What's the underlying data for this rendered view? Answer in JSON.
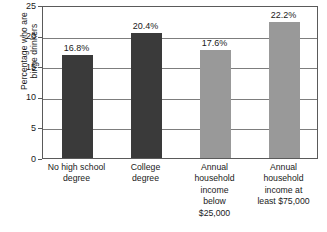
{
  "chart_data": {
    "type": "bar",
    "title": "",
    "xlabel": "",
    "ylabel": "Percentage who are binge drinkers",
    "ylabel_lines": [
      "Percentage who are",
      "binge drinkers"
    ],
    "ylim": [
      0,
      25
    ],
    "yticks": [
      0,
      5,
      10,
      15,
      20,
      25
    ],
    "ytick_labels": [
      "0",
      "5",
      "10",
      "15",
      "20",
      "25"
    ],
    "grid": true,
    "legend": "none",
    "categories": [
      "No high school degree",
      "College degree",
      "Annual household income below $25,000",
      "Annual household income at least $75,000"
    ],
    "category_lines": [
      [
        "No high school",
        "degree"
      ],
      [
        "College",
        "degree"
      ],
      [
        "Annual",
        "household",
        "income",
        "below",
        "$25,000"
      ],
      [
        "Annual",
        "household",
        "income at",
        "least $75,000"
      ]
    ],
    "values": [
      16.8,
      20.4,
      17.6,
      22.2
    ],
    "data_labels": [
      "16.8%",
      "20.4%",
      "17.6%",
      "22.2%"
    ],
    "bar_colors": [
      "#3a3a3a",
      "#3a3a3a",
      "#999999",
      "#999999"
    ],
    "colors": {
      "dark_bar": "#3a3a3a",
      "light_bar": "#999999",
      "gridline": "#7d7d7d",
      "frame": "#5a5a5a",
      "text": "#1a1a1a",
      "background": "#ffffff"
    }
  }
}
